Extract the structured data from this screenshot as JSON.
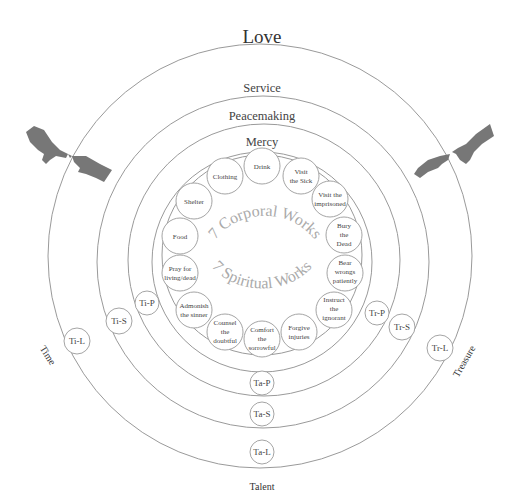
{
  "rings": {
    "love": "Love",
    "service": "Service",
    "peacemaking": "Peacemaking",
    "mercy": "Mercy"
  },
  "arc_labels": {
    "corporal": "7 Corporal Works",
    "spiritual": "7 Spiritual Works"
  },
  "corporal_works": [
    [
      "Food"
    ],
    [
      "Shelter"
    ],
    [
      "Clothing"
    ],
    [
      "Drink"
    ],
    [
      "Visit",
      "the Sick"
    ],
    [
      "Visit the",
      "imprisoned"
    ],
    [
      "Bury",
      "the",
      "Dead"
    ]
  ],
  "spiritual_works": [
    [
      "Pray for",
      "living/dead"
    ],
    [
      "Admonish",
      "the sinner"
    ],
    [
      "Counsel",
      "the",
      "doubtful"
    ],
    [
      "Comfort",
      "the",
      "sorrowful"
    ],
    [
      "Forgive",
      "injuries"
    ],
    [
      "Instruct",
      "the",
      "ignorant"
    ],
    [
      "Bear",
      "wrongs",
      "patiently"
    ]
  ],
  "time_markers": [
    "Ti-P",
    "Ti-S",
    "Ti-L"
  ],
  "treasure_markers": [
    "Tr-P",
    "Tr-S",
    "Tr-L"
  ],
  "talent_markers": [
    "Ta-P",
    "Ta-S",
    "Ta-L"
  ],
  "side_labels": {
    "time": "Time",
    "treasure": "Treasure",
    "talent": "Talent"
  },
  "images": {
    "left": "creation-of-adam-hands-left",
    "right": "creation-of-adam-hands-right"
  }
}
